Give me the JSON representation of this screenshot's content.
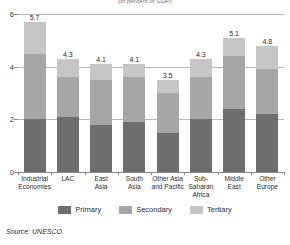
{
  "chart_data": {
    "type": "bar",
    "stacked": true,
    "title": "",
    "subtitle": "(in percent of GDP)",
    "xlabel": "",
    "ylabel": "",
    "ylim": [
      0,
      6
    ],
    "yticks": [
      0,
      2,
      4,
      6
    ],
    "ytick_labels": [
      "0",
      "2",
      "4",
      "6"
    ],
    "grid": true,
    "legend_position": "bottom",
    "categories": [
      "Industrial\nEconomies",
      "LAC",
      "East\nAsia",
      "South\nAsia",
      "Other Asia\nand Pacific",
      "Sub-\nSaharan\nAfrica",
      "Middle\nEast",
      "Other\nEurope"
    ],
    "totals": [
      5.7,
      4.3,
      4.1,
      4.1,
      3.5,
      4.3,
      5.1,
      4.8
    ],
    "total_labels": [
      "5.7",
      "4.3",
      "4.1",
      "4.1",
      "3.5",
      "4.3",
      "5.1",
      "4.8"
    ],
    "series": [
      {
        "name": "Primary",
        "color": "#6e6e6e",
        "values": [
          2.0,
          2.1,
          1.8,
          1.9,
          1.5,
          2.0,
          2.4,
          2.2
        ]
      },
      {
        "name": "Secondary",
        "color": "#a6a6a6",
        "values": [
          2.5,
          1.5,
          1.7,
          1.7,
          1.5,
          1.6,
          2.0,
          1.7
        ]
      },
      {
        "name": "Tertiary",
        "color": "#c6c6c6",
        "values": [
          1.2,
          0.7,
          0.6,
          0.5,
          0.5,
          0.7,
          0.7,
          0.9
        ]
      }
    ],
    "source": "Source: UNESCO."
  }
}
